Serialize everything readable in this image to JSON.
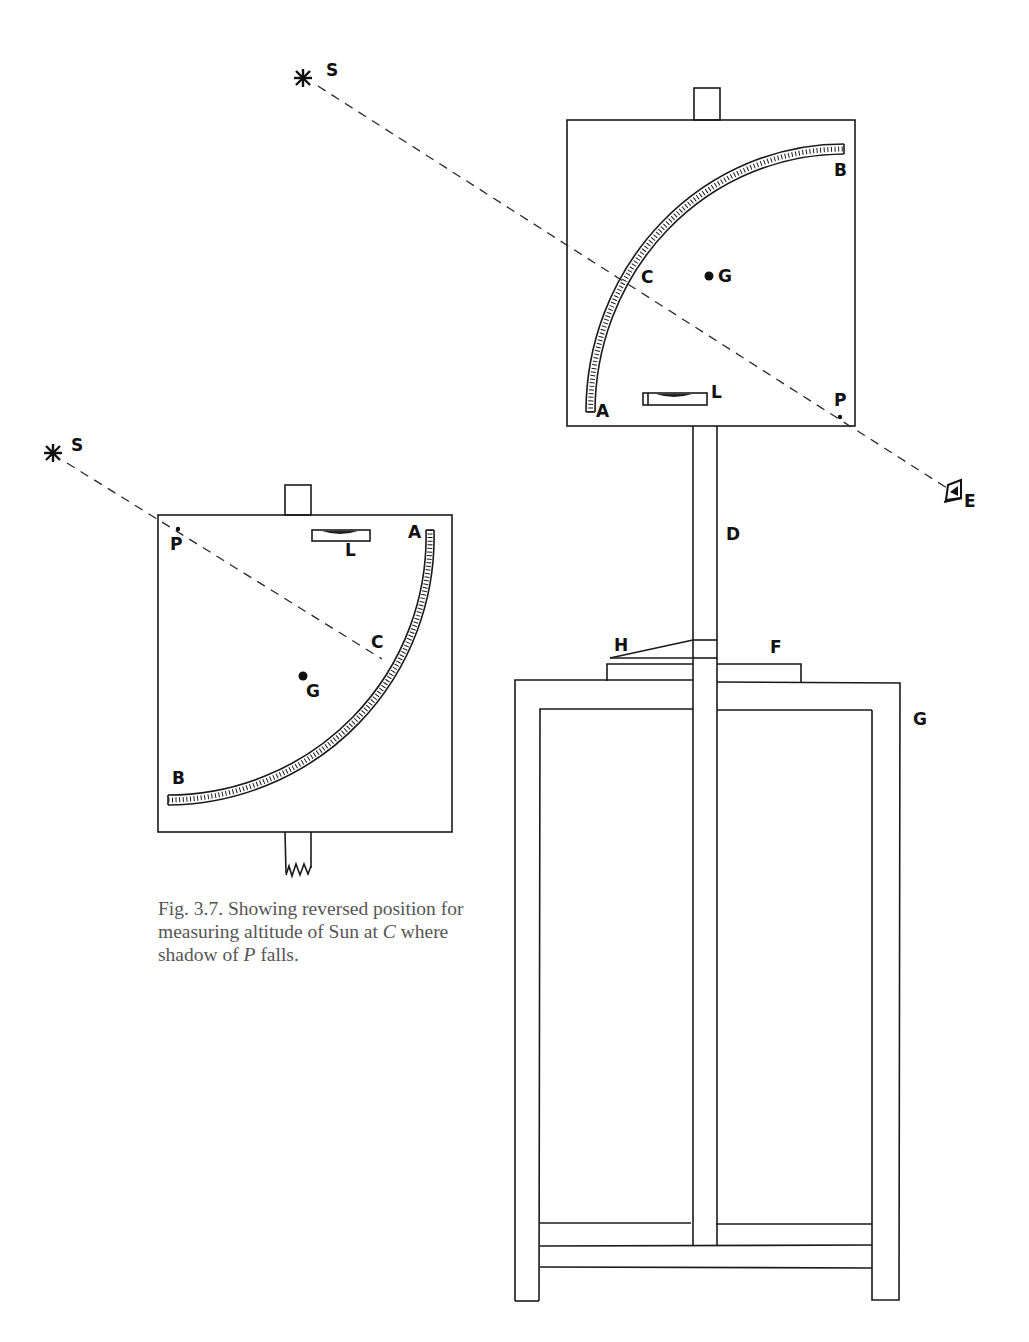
{
  "figure": {
    "caption": {
      "prefix": "Fig.  3.7. Showing reversed position for measuring altitude of Sun at ",
      "var_c": "C",
      "middle": " where shadow of ",
      "var_p": "P",
      "suffix": " falls."
    },
    "upright_instrument": {
      "labels": {
        "sun": "S",
        "arc_start": "A",
        "arc_end": "B",
        "shadow_point": "C",
        "plumb_center": "G",
        "level": "L",
        "pin": "P",
        "eye": "E",
        "post": "D",
        "wedge": "H",
        "collar": "F",
        "stand": "G"
      }
    },
    "reversed_instrument": {
      "labels": {
        "sun": "S",
        "arc_start": "A",
        "arc_end": "B",
        "shadow_point": "C",
        "plumb_center": "G",
        "level": "L",
        "pin": "P"
      }
    },
    "colors": {
      "ink": "#1a1a1a",
      "caption_text": "#555555",
      "background": "#ffffff"
    }
  }
}
